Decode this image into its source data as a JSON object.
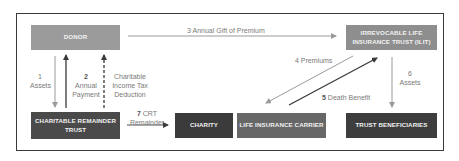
{
  "diagram": {
    "nodes": {
      "donor": {
        "label": "DONOR",
        "color": "#9b9b9b"
      },
      "ilit": {
        "label_line1": "IRREVOCABLE LIFE",
        "label_line2": "INSURANCE TRUST (ILIT)",
        "color": "#8e8e8e"
      },
      "crt": {
        "label_line1": "CHARITABLE REMAINDER",
        "label_line2": "TRUST",
        "color": "#4a4a4a"
      },
      "charity": {
        "label": "CHARITY",
        "color": "#3b3b3b"
      },
      "carrier": {
        "label": "LIFE INSURANCE CARRIER",
        "color": "#676767"
      },
      "beneficiaries": {
        "label": "TRUST BENEFICIARIES",
        "color": "#3d3d3d"
      }
    },
    "edges": {
      "e1": {
        "num": "1",
        "text": "Assets"
      },
      "e2": {
        "num": "2",
        "text_line1": "Annual",
        "text_line2": "Payment"
      },
      "e_tax": {
        "text_line1": "Charitable",
        "text_line2": "Income Tax",
        "text_line3": "Deduction"
      },
      "e3": {
        "num": "3",
        "text": "Annual Gift of Premium"
      },
      "e4": {
        "num": "4",
        "text": "Premiums"
      },
      "e5": {
        "num": "5",
        "text": "Death Benefit"
      },
      "e6": {
        "num": "6",
        "text": "Assets"
      },
      "e7": {
        "num": "7",
        "text_line1": "CRT",
        "text_line2": "Remainder"
      }
    }
  }
}
